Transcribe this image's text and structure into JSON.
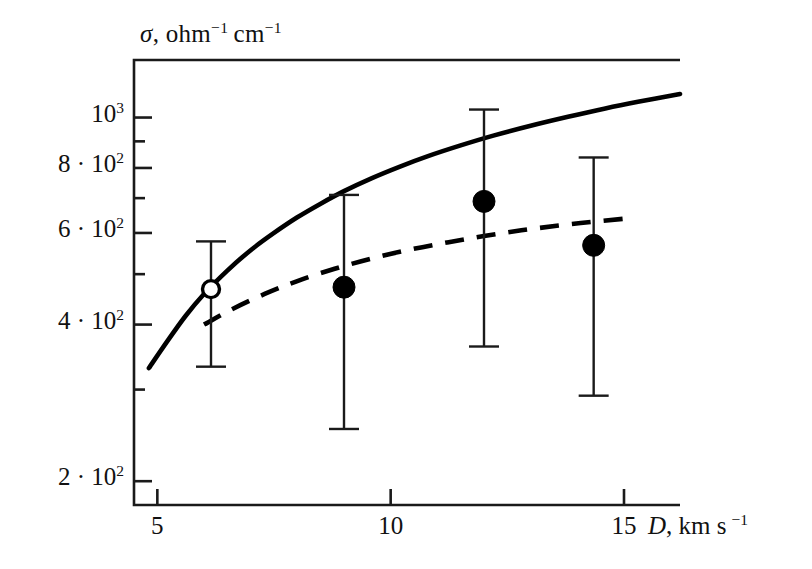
{
  "chart_data": {
    "type": "scatter",
    "title": "",
    "xlabel": "D, km s^-1",
    "ylabel": "sigma, ohm^-1 cm^-1",
    "xlabel_parts": {
      "sym": "D",
      "rest": ", km s",
      "exp": "−1"
    },
    "ylabel_parts": {
      "sym": "σ",
      "rest": ", ohm",
      "exp1": "−1",
      "rest2": "cm",
      "exp2": "−1"
    },
    "xscale": "linear",
    "yscale": "log",
    "xlim": [
      4.5,
      16.2
    ],
    "ylim": [
      180,
      1290
    ],
    "grid": false,
    "legend": "none",
    "xticks": [
      5,
      10,
      15
    ],
    "xticklabels": [
      "5",
      "10",
      "15"
    ],
    "yticks": [
      200,
      400,
      600,
      800,
      1000
    ],
    "yticklabels": [
      "2 · 10²",
      "4 · 10²",
      "6 · 10²",
      "8 · 10²",
      "10³"
    ],
    "yticklabels_parts": [
      {
        "coef": "2 · ",
        "base": "10",
        "exp": "2"
      },
      {
        "coef": "4 · ",
        "base": "10",
        "exp": "2"
      },
      {
        "coef": "6 · ",
        "base": "10",
        "exp": "2"
      },
      {
        "coef": "8 · ",
        "base": "10",
        "exp": "2"
      },
      {
        "coef": "",
        "base": "10",
        "exp": "3"
      }
    ],
    "yminorticks": [
      300,
      500,
      700,
      900
    ],
    "series": [
      {
        "name": "solid-curve",
        "type": "line",
        "style": "solid",
        "color": "#000000",
        "x": [
          4.82,
          5.2,
          5.6,
          6.0,
          6.5,
          7.0,
          7.5,
          8.0,
          8.5,
          9.0,
          9.6,
          10.2,
          10.8,
          11.5,
          12.2,
          13.0,
          13.8,
          14.6,
          15.3,
          16.2
        ],
        "y": [
          330,
          370,
          415,
          458,
          508,
          556,
          600,
          643,
          683,
          722,
          765,
          805,
          843,
          884,
          923,
          964,
          1003,
          1041,
          1072,
          1110
        ]
      },
      {
        "name": "dashed-curve",
        "type": "line",
        "style": "dashed",
        "color": "#000000",
        "x": [
          6.0,
          6.6,
          7.3,
          8.0,
          8.8,
          9.6,
          10.4,
          11.2,
          12.0,
          12.8,
          13.6,
          14.3,
          15.0
        ],
        "y": [
          400,
          428,
          458,
          485,
          512,
          536,
          557,
          575,
          592,
          607,
          620,
          630,
          639
        ]
      },
      {
        "name": "data-points",
        "type": "scatter",
        "color": "#000000",
        "points": [
          {
            "x": 6.15,
            "y": 468,
            "yerr_low": 332,
            "yerr_high": 578,
            "marker": "open-circle"
          },
          {
            "x": 9.0,
            "y": 472,
            "yerr_low": 252,
            "yerr_high": 710,
            "marker": "filled-circle"
          },
          {
            "x": 12.0,
            "y": 690,
            "yerr_low": 363,
            "yerr_high": 1036,
            "marker": "filled-circle"
          },
          {
            "x": 14.35,
            "y": 568,
            "yerr_low": 292,
            "yerr_high": 838,
            "marker": "filled-circle"
          }
        ]
      }
    ]
  },
  "figure": {
    "frame_color": "#1a1a1a",
    "background": "#ffffff"
  }
}
